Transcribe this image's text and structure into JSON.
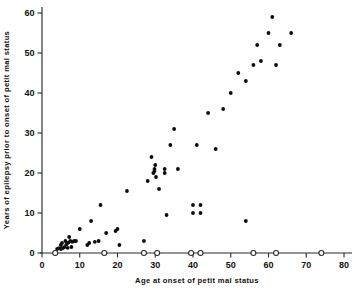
{
  "chart_data": {
    "type": "scatter",
    "title": "",
    "xlabel": "Age at onset of petit mal status",
    "ylabel": "Years of epilepsy prior to onset of petit mal status",
    "xlim": [
      0,
      80
    ],
    "ylim": [
      0,
      62
    ],
    "xticks": [
      0,
      10,
      20,
      30,
      40,
      50,
      60,
      70,
      80
    ],
    "xtick_labels": [
      "0",
      "10",
      "20",
      "30",
      "40",
      "50",
      "60",
      "70",
      "80"
    ],
    "yticks": [
      0,
      10,
      20,
      30,
      40,
      50,
      60
    ],
    "ytick_labels": [
      "0",
      "10",
      "20",
      "30",
      "40",
      "50",
      "60"
    ],
    "grid": false,
    "legend": false,
    "series": [
      {
        "name": "petit mal status cases with prior epilepsy",
        "marker": "filled-circle",
        "color": "#0c0c0c",
        "points": [
          [
            4,
            1
          ],
          [
            4.5,
            1.2
          ],
          [
            5,
            1
          ],
          [
            5,
            2
          ],
          [
            5.3,
            2.5
          ],
          [
            5.5,
            1.2
          ],
          [
            6,
            1.5
          ],
          [
            6.2,
            3
          ],
          [
            6.5,
            2.2
          ],
          [
            6.8,
            1.3
          ],
          [
            7,
            2.6
          ],
          [
            7.2,
            4
          ],
          [
            7.5,
            3
          ],
          [
            7.8,
            1.5
          ],
          [
            8,
            2.8
          ],
          [
            8.5,
            3
          ],
          [
            9,
            3
          ],
          [
            10,
            6
          ],
          [
            12,
            2
          ],
          [
            12.5,
            2.5
          ],
          [
            13,
            8
          ],
          [
            14,
            2.8
          ],
          [
            15,
            3
          ],
          [
            15.5,
            12
          ],
          [
            17,
            5
          ],
          [
            19.5,
            5.5
          ],
          [
            20,
            6
          ],
          [
            20.5,
            2
          ],
          [
            22.5,
            15.5
          ],
          [
            27,
            3
          ],
          [
            28,
            18
          ],
          [
            29,
            24
          ],
          [
            29.5,
            20
          ],
          [
            29.8,
            21
          ],
          [
            29.8,
            20.5
          ],
          [
            30,
            22
          ],
          [
            30.2,
            19
          ],
          [
            31,
            16
          ],
          [
            32.5,
            21
          ],
          [
            32.5,
            20
          ],
          [
            33,
            9.5
          ],
          [
            34,
            27
          ],
          [
            35,
            31
          ],
          [
            36,
            21
          ],
          [
            40,
            10
          ],
          [
            40,
            12
          ],
          [
            42,
            10
          ],
          [
            42,
            12
          ],
          [
            41,
            27
          ],
          [
            44,
            35
          ],
          [
            46,
            26
          ],
          [
            48,
            36
          ],
          [
            50,
            40
          ],
          [
            52,
            45
          ],
          [
            54,
            43
          ],
          [
            54,
            8
          ],
          [
            56,
            47
          ],
          [
            57,
            52
          ],
          [
            58,
            48
          ],
          [
            60,
            55
          ],
          [
            61,
            59
          ],
          [
            62,
            47
          ],
          [
            63,
            52
          ],
          [
            66,
            55
          ]
        ]
      },
      {
        "name": "petit mal status cases with no prior epilepsy",
        "marker": "open-circle",
        "color": "#ffffff",
        "points": [
          [
            3.5,
            0
          ],
          [
            16.5,
            0
          ],
          [
            27,
            0
          ],
          [
            30.5,
            0
          ],
          [
            39.5,
            0
          ],
          [
            42,
            0
          ],
          [
            56,
            0
          ],
          [
            62,
            0
          ],
          [
            74,
            0
          ]
        ]
      }
    ]
  },
  "figure": {
    "background_color": "#ffffff",
    "axis_color": "#2a2a2a",
    "marker_color": "#0c0c0c"
  }
}
